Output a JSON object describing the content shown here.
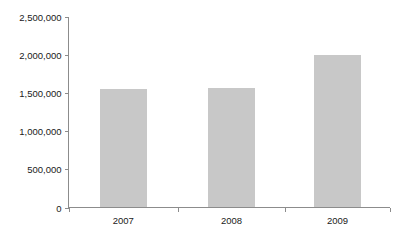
{
  "chart_data": {
    "type": "bar",
    "title": "",
    "subtitle": "",
    "xlabel": "",
    "ylabel": "",
    "categories": [
      "2007",
      "2008",
      "2009"
    ],
    "values": [
      1555000,
      1570000,
      2000000
    ],
    "series": [
      {
        "name": "",
        "values": [
          1555000,
          1570000,
          2000000
        ]
      }
    ],
    "ylim": [
      0,
      2500000
    ],
    "y_ticks": [
      0,
      500000,
      1000000,
      1500000,
      2000000,
      2500000
    ],
    "y_tick_labels": [
      "0",
      "500,000",
      "1,000,000",
      "1,500,000",
      "2,000,000",
      "2,500,000"
    ],
    "x_tick_labels": [
      "2007",
      "2008",
      "2009"
    ],
    "grid": false,
    "legend": false,
    "legend_position": "none",
    "annotations": [],
    "colors": {
      "bar_fill": "#c8c8c8",
      "axis_line": "#8c8c8c",
      "text": "#1a1a1a",
      "background": "#ffffff"
    }
  },
  "axis": {
    "y_labels": [
      {
        "text": "2,500,000",
        "value": 2500000
      },
      {
        "text": "2,000,000",
        "value": 2000000
      },
      {
        "text": "1,500,000",
        "value": 1500000
      },
      {
        "text": "1,000,000",
        "value": 1000000
      },
      {
        "text": "500,000",
        "value": 500000
      },
      {
        "text": "0",
        "value": 0
      }
    ],
    "x_labels": [
      {
        "text": "2007"
      },
      {
        "text": "2008"
      },
      {
        "text": "2009"
      }
    ]
  }
}
